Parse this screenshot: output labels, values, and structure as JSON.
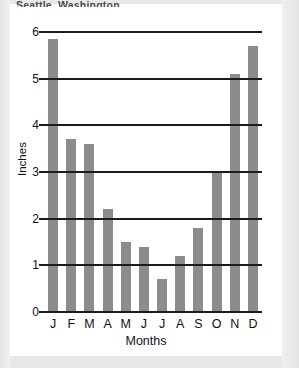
{
  "figure": {
    "title": "Seattle, Washington"
  },
  "chart_data": {
    "type": "bar",
    "title": "Seattle, Washington",
    "xlabel": "Months",
    "ylabel": "Inches",
    "categories": [
      "J",
      "F",
      "M",
      "A",
      "M",
      "J",
      "J",
      "A",
      "S",
      "O",
      "N",
      "D"
    ],
    "values": [
      5.85,
      3.7,
      3.6,
      2.2,
      1.5,
      1.4,
      0.7,
      1.2,
      1.8,
      3.0,
      5.1,
      5.7
    ],
    "ylim": [
      0,
      6
    ],
    "yticks": [
      0,
      1,
      2,
      3,
      4,
      5,
      6
    ],
    "ytick_labels": [
      "0",
      "1",
      "2",
      "3",
      "4",
      "5",
      "6"
    ],
    "grid": true,
    "legend": false,
    "bar_color": "#8c8c8c",
    "axis_color": "#1c1c1c"
  }
}
